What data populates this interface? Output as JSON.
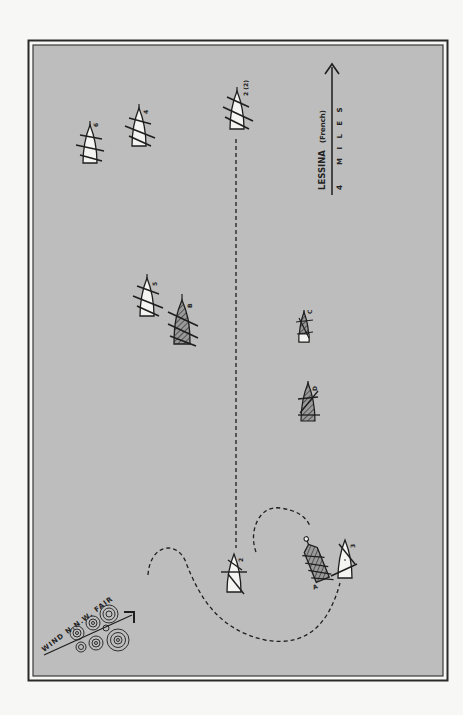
{
  "diagram": {
    "type": "naval-battle-map",
    "colors": {
      "page": "#f7f7f5",
      "sea": "#bdbdbd",
      "frame": "#2a2a2a",
      "ship_white": "#f4f4f2",
      "ship_enemy_fill": "#8a8a8a",
      "ink": "#1e1e1e"
    },
    "scale_bar": {
      "title": "LESSINA",
      "subtitle": "(French)",
      "distance": "4",
      "units": "M I L E S",
      "direction": "north-arrow"
    },
    "wind": {
      "label": "WIND N.N.W. FAIR",
      "icon": "wind-rose-icon"
    },
    "ships": [
      {
        "id": "6",
        "label": "6",
        "side": "british",
        "fill": "white",
        "x": 90,
        "y": 145
      },
      {
        "id": "4",
        "label": "4",
        "side": "british",
        "fill": "white",
        "x": 139,
        "y": 128
      },
      {
        "id": "2-position-2",
        "label": "2 (2)",
        "side": "british",
        "fill": "white",
        "x": 237,
        "y": 111
      },
      {
        "id": "5",
        "label": "5",
        "side": "british",
        "fill": "white",
        "x": 147,
        "y": 298
      },
      {
        "id": "B",
        "label": "B",
        "side": "french",
        "fill": "hatched",
        "x": 182,
        "y": 322
      },
      {
        "id": "C",
        "label": "C",
        "side": "french",
        "fill": "hatched",
        "x": 304,
        "y": 328
      },
      {
        "id": "D",
        "label": "D",
        "side": "french",
        "fill": "hatched",
        "x": 308,
        "y": 403
      },
      {
        "id": "2",
        "label": "2",
        "side": "british",
        "fill": "white",
        "x": 234,
        "y": 574
      },
      {
        "id": "A",
        "label": "A",
        "side": "french",
        "fill": "hatched",
        "x": 316,
        "y": 563
      },
      {
        "id": "3",
        "label": "3",
        "side": "british",
        "fill": "white",
        "x": 345,
        "y": 560
      }
    ],
    "tracks": [
      {
        "name": "ship-2-straight-track",
        "style": "dashed"
      },
      {
        "name": "ship-3-curved-track",
        "style": "dashed"
      },
      {
        "name": "ship-A-loop-track",
        "style": "dashed"
      }
    ]
  }
}
